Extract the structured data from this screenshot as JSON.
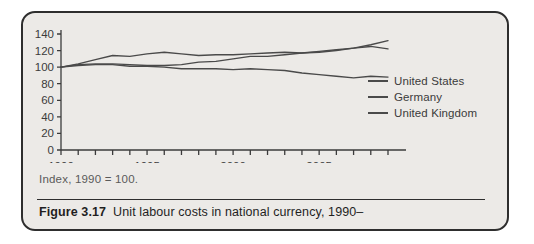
{
  "figure": {
    "label": "Figure 3.17",
    "caption_text": "Unit labour costs in national currency, 1990–",
    "note": "Index, 1990 = 100."
  },
  "legend": {
    "position": "right",
    "entries": [
      {
        "label": "United States",
        "color": "#4a4a4a"
      },
      {
        "label": "Germany",
        "color": "#4a4a4a"
      },
      {
        "label": "United Kingdom",
        "color": "#4a4a4a"
      }
    ]
  },
  "axes": {
    "y_ticks": [
      "0",
      "20",
      "40",
      "60",
      "80",
      "100",
      "120",
      "140"
    ],
    "x_ticks_labeled": [
      "1990",
      "1995",
      "2000",
      "2005"
    ]
  },
  "colors": {
    "card_background": "#eceae7",
    "card_border": "#2e2e2e",
    "line": "#4a4a4a",
    "axis": "#3b3b3b",
    "text": "#1f1f1f",
    "note_text": "#5a5a5a"
  },
  "chart_data": {
    "type": "line",
    "title": "Unit labour costs in national currency, 1990–",
    "subtitle": "Index, 1990 = 100.",
    "xlabel": "",
    "ylabel": "",
    "xlim": [
      1990,
      2009
    ],
    "ylim": [
      0,
      140
    ],
    "yticks": [
      0,
      20,
      40,
      60,
      80,
      100,
      120,
      140
    ],
    "xticks": [
      1990,
      1991,
      1992,
      1993,
      1994,
      1995,
      1996,
      1997,
      1998,
      1999,
      2000,
      2001,
      2002,
      2003,
      2004,
      2005,
      2006,
      2007,
      2008,
      2009
    ],
    "xticklabels_shown": [
      1990,
      1995,
      2000,
      2005
    ],
    "grid": false,
    "legend_position": "right",
    "x": [
      1990,
      1991,
      1992,
      1993,
      1994,
      1995,
      1996,
      1997,
      1998,
      1999,
      2000,
      2001,
      2002,
      2003,
      2004,
      2005,
      2006,
      2007,
      2008,
      2009
    ],
    "series": [
      {
        "name": "United States",
        "color": "#4a4a4a",
        "values": [
          100,
          103,
          104,
          104,
          103,
          102,
          102,
          103,
          106,
          107,
          110,
          113,
          113,
          115,
          117,
          119,
          121,
          123,
          125,
          122
        ]
      },
      {
        "name": "Germany",
        "color": "#4a4a4a",
        "values": [
          100,
          102,
          103,
          103,
          101,
          101,
          100,
          98,
          98,
          98,
          97,
          98,
          97,
          96,
          93,
          91,
          89,
          87,
          89,
          88
        ]
      },
      {
        "name": "United Kingdom",
        "color": "#4a4a4a",
        "values": [
          100,
          104,
          109,
          114,
          113,
          116,
          118,
          116,
          114,
          115,
          115,
          116,
          117,
          118,
          117,
          118,
          120,
          123,
          127,
          132
        ]
      }
    ]
  }
}
